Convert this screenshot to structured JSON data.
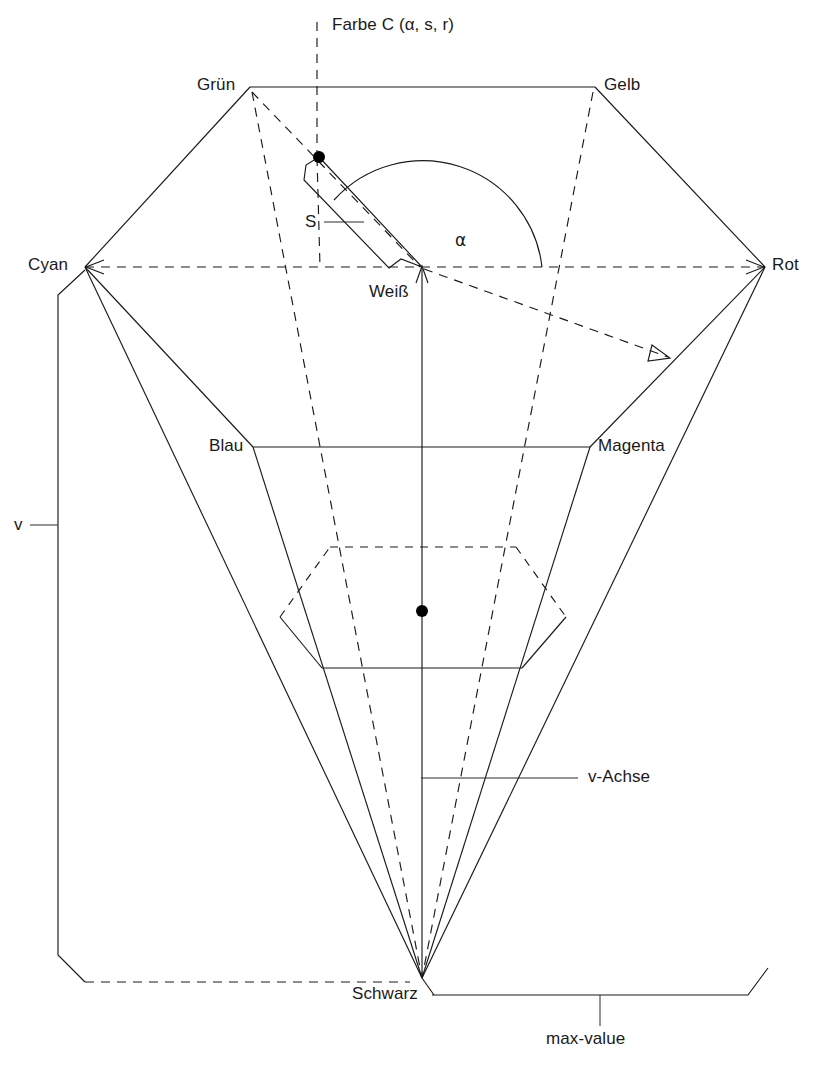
{
  "figure": {
    "type": "diagram",
    "labels": {
      "farbe_c": "Farbe C (α, s, r)",
      "gruen": "Grün",
      "gelb": "Gelb",
      "cyan": "Cyan",
      "rot": "Rot",
      "weiss": "Weiß",
      "blau": "Blau",
      "magenta": "Magenta",
      "schwarz": "Schwarz",
      "s_vector": "S",
      "alpha": "α",
      "v": "v",
      "v_achse": "v-Achse",
      "max_value": "max-value"
    },
    "colors": {
      "stroke": "#1a1a1a",
      "background": "#ffffff",
      "point": "#000000"
    },
    "geometry": {
      "top_hexagon": [
        {
          "name": "Grün",
          "x": 250,
          "y": 87
        },
        {
          "name": "Gelb",
          "x": 595,
          "y": 87
        },
        {
          "name": "Rot",
          "x": 765,
          "y": 267
        },
        {
          "name": "Magenta",
          "x": 590,
          "y": 447
        },
        {
          "name": "Blau",
          "x": 253,
          "y": 447
        },
        {
          "name": "Cyan",
          "x": 85,
          "y": 267
        }
      ],
      "white_center": {
        "x": 422,
        "y": 267
      },
      "black_apex": {
        "x": 422,
        "y": 978
      },
      "color_point_C": {
        "x": 319,
        "y": 157
      },
      "inner_hexagon_center": {
        "x": 422,
        "y": 611
      },
      "alpha_arc_radius": 120,
      "alpha_arc_start_deg": 0,
      "alpha_arc_end_deg": 137
    }
  }
}
